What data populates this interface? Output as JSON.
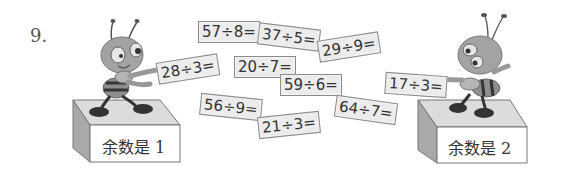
{
  "question_number": "9.",
  "cards": [
    {
      "id": "57div8",
      "text": "57÷8=",
      "x": 198,
      "y": 21,
      "rot": 0
    },
    {
      "id": "37div5",
      "text": "37÷5=",
      "x": 258,
      "y": 26,
      "rot": 7
    },
    {
      "id": "29div9",
      "text": "29÷9=",
      "x": 318,
      "y": 36,
      "rot": -9
    },
    {
      "id": "28div3",
      "text": "28÷3=",
      "x": 157,
      "y": 58,
      "rot": -9
    },
    {
      "id": "20div7",
      "text": "20÷7=",
      "x": 234,
      "y": 56,
      "rot": 0
    },
    {
      "id": "59div6",
      "text": "59÷6=",
      "x": 280,
      "y": 74,
      "rot": 0
    },
    {
      "id": "56div9",
      "text": "56÷9=",
      "x": 200,
      "y": 96,
      "rot": 6
    },
    {
      "id": "21div3",
      "text": "21÷3=",
      "x": 258,
      "y": 114,
      "rot": -6
    },
    {
      "id": "64div7",
      "text": "64÷7=",
      "x": 335,
      "y": 99,
      "rot": 8
    },
    {
      "id": "17div3",
      "text": "17÷3=",
      "x": 385,
      "y": 74,
      "rot": 4
    }
  ],
  "boxes": [
    {
      "id": "remainder-1",
      "label": "余数是 1"
    },
    {
      "id": "remainder-2",
      "label": "余数是 2"
    }
  ],
  "colors": {
    "card_bg": "#ececec",
    "card_border": "#8a8a8a",
    "text": "#333333",
    "ant_body": "#9a9a9a",
    "ant_dark": "#3a3a3a",
    "box_top": "#d8d8d8",
    "box_side": "#a8a8a8",
    "box_front": "#ffffff"
  }
}
